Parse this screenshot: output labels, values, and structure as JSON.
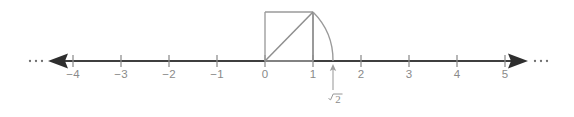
{
  "figure": {
    "background_color": "#ffffff",
    "axis_color": "#3f3f3f",
    "tick_color": "#8c8c8c",
    "label_color": "#8a8a8a",
    "construction_color": "#9a9a9a"
  },
  "number_line": {
    "origin_x": 265,
    "baseline_y": 61,
    "unit_px": 48,
    "left_end_x": 40,
    "right_end_x": 540,
    "tick_half_height": 6,
    "left_ellipsis": "…",
    "right_ellipsis": "…",
    "ticks": [
      {
        "value": -4,
        "label": "−4",
        "x": 73
      },
      {
        "value": -3,
        "label": "−3",
        "x": 121
      },
      {
        "value": -2,
        "label": "−2",
        "x": 169
      },
      {
        "value": -1,
        "label": "−1",
        "x": 217
      },
      {
        "value": 0,
        "label": "0",
        "x": 265
      },
      {
        "value": 1,
        "label": "1",
        "x": 313
      },
      {
        "value": 2,
        "label": "2",
        "x": 361
      },
      {
        "value": 3,
        "label": "3",
        "x": 409
      },
      {
        "value": 4,
        "label": "4",
        "x": 457
      },
      {
        "value": 5,
        "label": "5",
        "x": 505
      }
    ],
    "label_baseline_y": 78
  },
  "construction": {
    "unit_square": {
      "x0": 265,
      "y0": 12,
      "x1": 313,
      "y1": 61,
      "side_label": "1"
    },
    "diagonal": {
      "from_x": 265,
      "from_y": 61,
      "to_x": 313,
      "to_y": 12,
      "length_label": "√2"
    },
    "arc": {
      "center_x": 265,
      "center_y": 61,
      "radius": 68,
      "start_x": 313,
      "start_y": 12,
      "end_x": 333,
      "end_y": 61
    },
    "drop_line": {
      "x": 313,
      "from_y": 12,
      "to_y": 61
    },
    "marked_point": {
      "value_label": "√2",
      "radical_symbol": "√",
      "radicand": "2",
      "x": 333,
      "approx_value": 1.414
    },
    "pointer": {
      "x": 333,
      "tip_y": 65,
      "tail_y": 90
    },
    "label_position": {
      "x": 337,
      "y": 101
    }
  }
}
